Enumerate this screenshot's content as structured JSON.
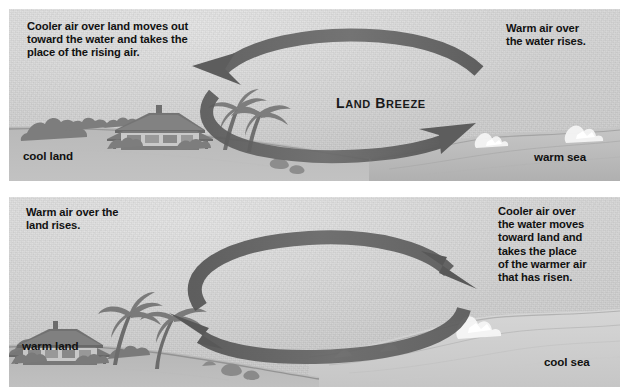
{
  "diagram": {
    "colors": {
      "sky": "#d3d3d3",
      "arrow": "#5e5e5e",
      "land": "#8c8c8c",
      "sea": "#bdbdbd",
      "text": "#111111",
      "page": "#ffffff"
    }
  },
  "panels": [
    {
      "id": "land-breeze",
      "breeze_label": {
        "word1_cap": "L",
        "word1_rest": "AND",
        "word2_cap": "B",
        "word2_rest": "REEZE"
      },
      "caption_left": "Cooler air over land moves out\ntoward the water and takes the\nplace of the rising air.",
      "caption_right": "Warm air over\nthe water rises.",
      "ground_label_left": "cool land",
      "ground_label_right": "warm sea",
      "circulation": "counterclockwise",
      "upper_arc_direction": "right-to-left",
      "lower_arc_direction": "left-to-right"
    },
    {
      "id": "sea-breeze",
      "breeze_label": {
        "word1_cap": "S",
        "word1_rest": "EA",
        "word2_cap": "B",
        "word2_rest": "REEZE"
      },
      "caption_left": "Warm air over the\nland rises.",
      "caption_right": "Cooler air over\nthe water moves\ntoward land and\ntakes the place\nof the warmer air\nthat has risen.",
      "ground_label_left": "warm land",
      "ground_label_right": "cool sea",
      "circulation": "clockwise",
      "upper_arc_direction": "left-to-right",
      "lower_arc_direction": "right-to-left"
    }
  ]
}
